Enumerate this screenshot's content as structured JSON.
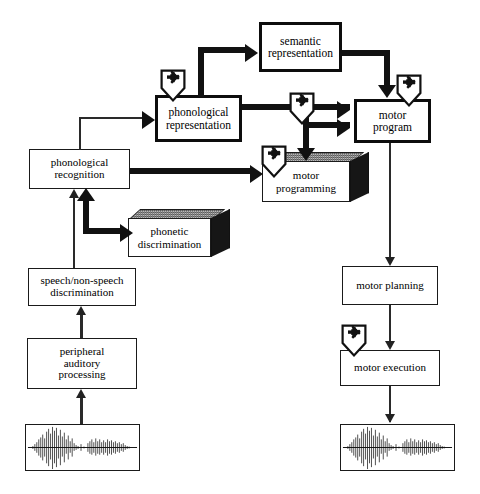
{
  "diagram": {
    "lesion_marker_glyph": "✖",
    "colors": {
      "stroke": "#111111",
      "box_fill": "#ffffff",
      "box3d_top": "#b9b9b9",
      "box3d_side": "#161616",
      "background": "#ffffff"
    },
    "nodes": [
      {
        "id": "semantic-representation",
        "label": "semantic representation",
        "style": "thick-2d"
      },
      {
        "id": "phonological-representation",
        "label": "phonological representation",
        "style": "thick-2d"
      },
      {
        "id": "motor-program",
        "label": "motor program",
        "style": "thick-2d"
      },
      {
        "id": "phonological-recognition",
        "label": "phonological recognition",
        "style": "thin-2d"
      },
      {
        "id": "motor-programming",
        "label": "motor programming",
        "style": "3d"
      },
      {
        "id": "phonetic-discrimination",
        "label": "phonetic discrimination",
        "style": "3d"
      },
      {
        "id": "speech-nonspeech-discrimination",
        "label": "speech/non-speech discrimination",
        "style": "thin-2d"
      },
      {
        "id": "peripheral-auditory-processing",
        "label": "peripheral auditory processing",
        "style": "thin-2d"
      },
      {
        "id": "motor-planning",
        "label": "motor planning",
        "style": "thin-2d"
      },
      {
        "id": "motor-execution",
        "label": "motor execution",
        "style": "thin-2d"
      },
      {
        "id": "input-waveform",
        "label": "",
        "style": "waveform"
      },
      {
        "id": "output-waveform",
        "label": "",
        "style": "waveform"
      }
    ],
    "node_labels": {
      "semantic_representation_line1": "semantic",
      "semantic_representation_line2": "representation",
      "phonological_representation_line1": "phonological",
      "phonological_representation_line2": "representation",
      "motor_program_line1": "motor",
      "motor_program_line2": "program",
      "phonological_recognition_line1": "phonological",
      "phonological_recognition_line2": "recognition",
      "motor_programming_line1": "motor",
      "motor_programming_line2": "programming",
      "phonetic_discrimination_line1": "phonetic",
      "phonetic_discrimination_line2": "discrimination",
      "speech_nonspeech_line1": "speech/non-speech",
      "speech_nonspeech_line2": "discrimination",
      "peripheral_line1": "peripheral",
      "peripheral_line2": "auditory",
      "peripheral_line3": "processing",
      "motor_planning": "motor planning",
      "motor_execution": "motor execution"
    },
    "lesions": [
      {
        "id": "lesion-phonological-representation",
        "attached_to": "phonological-representation"
      },
      {
        "id": "lesion-motor-program",
        "attached_to": "motor-program"
      },
      {
        "id": "lesion-phonological-to-motor-path",
        "attached_to": "phonological-representation-to-motor-program-link"
      },
      {
        "id": "lesion-motor-programming",
        "attached_to": "motor-programming"
      },
      {
        "id": "lesion-motor-execution",
        "attached_to": "motor-execution"
      }
    ],
    "edges": [
      {
        "from": "input-waveform",
        "to": "peripheral-auditory-processing",
        "weight": "thin"
      },
      {
        "from": "peripheral-auditory-processing",
        "to": "speech-nonspeech-discrimination",
        "weight": "thin"
      },
      {
        "from": "speech-nonspeech-discrimination",
        "to": "phonological-recognition",
        "weight": "thin"
      },
      {
        "from": "phonetic-discrimination",
        "to": "phonological-recognition",
        "weight": "thick"
      },
      {
        "from": "phonological-recognition",
        "to": "phonetic-discrimination",
        "weight": "thick"
      },
      {
        "from": "phonological-recognition",
        "to": "phonological-representation",
        "weight": "thin"
      },
      {
        "from": "phonological-recognition",
        "to": "motor-programming",
        "weight": "thick"
      },
      {
        "from": "phonological-representation",
        "to": "semantic-representation",
        "weight": "thick"
      },
      {
        "from": "semantic-representation",
        "to": "motor-program",
        "weight": "thick"
      },
      {
        "from": "phonological-representation",
        "to": "motor-program",
        "weight": "thick"
      },
      {
        "from": "phonological-representation",
        "to": "motor-programming",
        "weight": "thick"
      },
      {
        "from": "motor-programming",
        "to": "motor-program",
        "weight": "thick"
      },
      {
        "from": "motor-program",
        "to": "motor-planning",
        "weight": "thin"
      },
      {
        "from": "motor-planning",
        "to": "motor-execution",
        "weight": "thin"
      },
      {
        "from": "motor-execution",
        "to": "output-waveform",
        "weight": "thin"
      }
    ]
  }
}
